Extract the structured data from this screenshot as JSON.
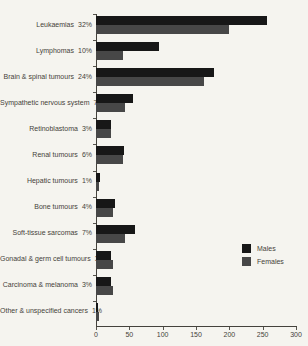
{
  "figure": {
    "background_color": "#f5f4ef",
    "axis_color": "#44423c",
    "text_color": "#45423a"
  },
  "legend": {
    "items": [
      {
        "label": "Males",
        "color": "#171717"
      },
      {
        "label": "Females",
        "color": "#474747"
      }
    ]
  },
  "chart_data": {
    "type": "bar",
    "orientation": "horizontal",
    "title": "",
    "xlabel": "",
    "ylabel": "",
    "xlim": [
      0,
      300
    ],
    "x_ticks": [
      0,
      50,
      100,
      150,
      200,
      250,
      300
    ],
    "grid": false,
    "legend_position": "right-lower",
    "categories": [
      "Leukaemias",
      "Lymphomas",
      "Brain & spinal tumours",
      "Sympathetic nervous system",
      "Retinoblastoma",
      "Renal tumours",
      "Hepatic tumours",
      "Bone tumours",
      "Soft-tissue sarcomas",
      "Gonadal & germ cell tumours",
      "Carcinoma & melanoma",
      "Other & unspecified cancers"
    ],
    "category_percents": [
      "32%",
      "10%",
      "24%",
      "7%",
      "3%",
      "6%",
      "1%",
      "4%",
      "7%",
      "3%",
      "3%",
      "1%"
    ],
    "series": [
      {
        "name": "Males",
        "color": "#171717",
        "values": [
          257,
          95,
          177,
          55,
          23,
          42,
          6,
          28,
          59,
          22,
          22,
          3
        ]
      },
      {
        "name": "Females",
        "color": "#474747",
        "values": [
          200,
          41,
          162,
          44,
          22,
          41,
          4,
          26,
          44,
          26,
          26,
          5
        ]
      }
    ]
  }
}
